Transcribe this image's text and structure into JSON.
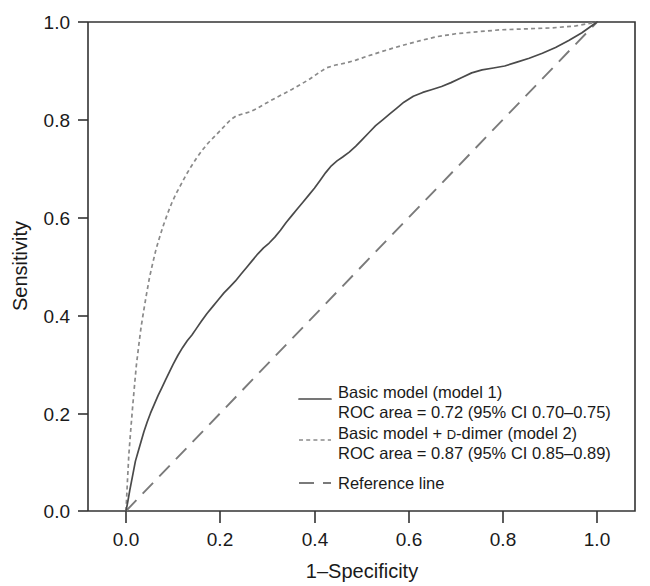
{
  "chart_data": {
    "type": "line",
    "title": "",
    "xlabel": "1–Specificity",
    "ylabel": "Sensitivity",
    "xlim": [
      0.0,
      1.0
    ],
    "ylim": [
      0.0,
      1.0
    ],
    "grid": false,
    "legend_position": "bottom-right",
    "xticks": [
      "0.0",
      "0.2",
      "0.4",
      "0.6",
      "0.8",
      "1.0"
    ],
    "xtick_values": [
      0.0,
      0.2,
      0.4,
      0.6,
      0.8,
      1.0
    ],
    "yticks": [
      "0.0",
      "0.2",
      "0.4",
      "0.6",
      "0.8",
      "1.0"
    ],
    "ytick_values": [
      0.0,
      0.2,
      0.4,
      0.6,
      0.8,
      1.0
    ],
    "series": [
      {
        "name": "Basic model (model 1)",
        "style": "solid",
        "color": "#4a4a4a",
        "roc_area": "0.72",
        "ci_low": "0.70",
        "ci_high": "0.75",
        "x": [
          0.0,
          0.004,
          0.008,
          0.012,
          0.016,
          0.02,
          0.026,
          0.032,
          0.038,
          0.045,
          0.052,
          0.06,
          0.068,
          0.076,
          0.084,
          0.092,
          0.1,
          0.11,
          0.12,
          0.13,
          0.14,
          0.15,
          0.16,
          0.172,
          0.184,
          0.196,
          0.208,
          0.22,
          0.232,
          0.244,
          0.256,
          0.268,
          0.28,
          0.292,
          0.304,
          0.316,
          0.328,
          0.34,
          0.352,
          0.364,
          0.376,
          0.388,
          0.4,
          0.412,
          0.424,
          0.436,
          0.448,
          0.46,
          0.474,
          0.488,
          0.502,
          0.516,
          0.53,
          0.545,
          0.56,
          0.575,
          0.59,
          0.61,
          0.63,
          0.65,
          0.67,
          0.69,
          0.712,
          0.734,
          0.756,
          0.78,
          0.804,
          0.83,
          0.856,
          0.884,
          0.912,
          0.94,
          0.968,
          1.0
        ],
        "y": [
          0.0,
          0.02,
          0.042,
          0.062,
          0.082,
          0.102,
          0.122,
          0.142,
          0.162,
          0.182,
          0.2,
          0.218,
          0.236,
          0.252,
          0.268,
          0.284,
          0.3,
          0.318,
          0.334,
          0.348,
          0.36,
          0.374,
          0.388,
          0.404,
          0.418,
          0.432,
          0.446,
          0.458,
          0.47,
          0.484,
          0.498,
          0.512,
          0.526,
          0.538,
          0.548,
          0.56,
          0.574,
          0.59,
          0.604,
          0.618,
          0.632,
          0.646,
          0.66,
          0.676,
          0.692,
          0.706,
          0.716,
          0.724,
          0.734,
          0.746,
          0.76,
          0.774,
          0.788,
          0.8,
          0.812,
          0.824,
          0.836,
          0.848,
          0.856,
          0.862,
          0.868,
          0.876,
          0.886,
          0.896,
          0.902,
          0.906,
          0.91,
          0.918,
          0.926,
          0.936,
          0.948,
          0.962,
          0.978,
          1.0
        ]
      },
      {
        "name": "Basic model + D-dimer (model 2)",
        "style": "dotted",
        "color": "#8a8a8a",
        "roc_area": "0.87",
        "ci_low": "0.85",
        "ci_high": "0.89",
        "x": [
          0.0,
          0.003,
          0.006,
          0.01,
          0.014,
          0.018,
          0.022,
          0.027,
          0.032,
          0.038,
          0.044,
          0.05,
          0.057,
          0.064,
          0.072,
          0.08,
          0.089,
          0.098,
          0.108,
          0.118,
          0.128,
          0.138,
          0.15,
          0.162,
          0.174,
          0.186,
          0.198,
          0.21,
          0.222,
          0.234,
          0.248,
          0.262,
          0.276,
          0.29,
          0.305,
          0.32,
          0.336,
          0.352,
          0.37,
          0.388,
          0.406,
          0.425,
          0.445,
          0.466,
          0.488,
          0.512,
          0.538,
          0.565,
          0.594,
          0.625,
          0.66,
          0.7,
          0.745,
          0.795,
          0.85,
          0.905,
          0.955,
          1.0
        ],
        "y": [
          0.0,
          0.06,
          0.115,
          0.165,
          0.212,
          0.256,
          0.298,
          0.338,
          0.376,
          0.412,
          0.446,
          0.478,
          0.508,
          0.536,
          0.562,
          0.586,
          0.61,
          0.632,
          0.652,
          0.67,
          0.688,
          0.704,
          0.722,
          0.738,
          0.752,
          0.764,
          0.776,
          0.788,
          0.8,
          0.808,
          0.812,
          0.816,
          0.822,
          0.83,
          0.838,
          0.846,
          0.854,
          0.862,
          0.872,
          0.882,
          0.894,
          0.906,
          0.912,
          0.916,
          0.922,
          0.93,
          0.938,
          0.946,
          0.954,
          0.962,
          0.97,
          0.976,
          0.98,
          0.984,
          0.986,
          0.988,
          0.992,
          1.0
        ]
      },
      {
        "name": "Reference line",
        "style": "dashed",
        "color": "#7a7a7a",
        "roc_area": null,
        "x": [
          0.0,
          1.0
        ],
        "y": [
          0.0,
          1.0
        ]
      }
    ]
  },
  "legend": {
    "entries": [
      {
        "marker": "solid-line-swatch",
        "line1": "Basic model (model 1)",
        "line2_pre": "ROC area = 0.72 (95% CI 0.70–0.75)"
      },
      {
        "marker": "dotted-line-swatch",
        "line1_a": "Basic model + ",
        "line1_smallcap": "D",
        "line1_b": "-dimer (model 2)",
        "line2_pre": "ROC area = 0.87 (95% CI 0.85–0.89)"
      },
      {
        "marker": "dashed-line-swatch",
        "line1": "Reference line"
      }
    ]
  },
  "axes": {
    "x_title": "1–Specificity",
    "y_title": "Sensitivity",
    "x_tick_labels": [
      "0.0",
      "0.2",
      "0.4",
      "0.6",
      "0.8",
      "1.0"
    ],
    "y_tick_labels": [
      "1.0",
      "0.8",
      "0.6",
      "0.4",
      "0.2",
      "0.0"
    ]
  },
  "colors": {
    "background": "#ffffff",
    "axis": "#333333",
    "model1": "#4a4a4a",
    "model2": "#8a8a8a",
    "reference": "#7a7a7a",
    "text": "#1a1a1a"
  }
}
